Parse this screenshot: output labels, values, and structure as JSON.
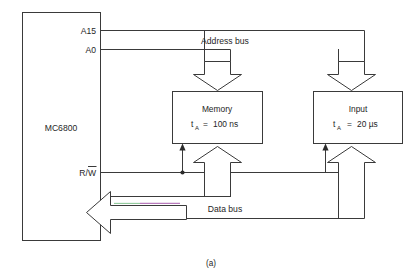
{
  "figure": {
    "caption": "(a)",
    "background_color": "#ffffff",
    "line_color": "#3a3a3a",
    "text_color": "#262626"
  },
  "cpu": {
    "label": "MC6800",
    "pins": [
      {
        "name": "A15",
        "label": "A15"
      },
      {
        "name": "A0",
        "label": "A0"
      },
      {
        "name": "RW",
        "label": "R/W",
        "overbar": "W"
      }
    ]
  },
  "buses": [
    {
      "name": "address-bus",
      "label": "Address bus"
    },
    {
      "name": "data-bus",
      "label": "Data bus"
    }
  ],
  "blocks": [
    {
      "name": "memory",
      "title": "Memory",
      "param_symbol": "t",
      "param_subscript": "A",
      "param_equals": "=",
      "param_value": "100 ns"
    },
    {
      "name": "input",
      "title": "Input",
      "param_symbol": "t",
      "param_subscript": "A",
      "param_equals": "=",
      "param_value": "20 µs"
    }
  ]
}
